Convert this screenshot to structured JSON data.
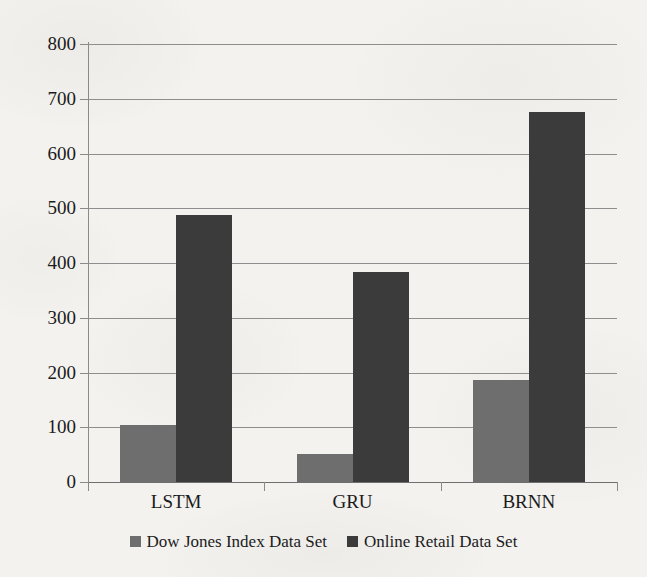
{
  "chart_data": {
    "type": "bar",
    "title": "",
    "xlabel": "",
    "ylabel": "",
    "categories": [
      "LSTM",
      "GRU",
      "BRNN"
    ],
    "series": [
      {
        "name": "Dow Jones Index Data Set",
        "color": "#6e6e6e",
        "values": [
          105,
          52,
          187
        ]
      },
      {
        "name": "Online Retail Data Set",
        "color": "#3b3b3b",
        "values": [
          487,
          383,
          676
        ]
      }
    ],
    "ylim": [
      0,
      800
    ],
    "ytick_step": 100,
    "yticks": [
      "0",
      "100",
      "200",
      "300",
      "400",
      "500",
      "600",
      "700",
      "800"
    ],
    "grid": true,
    "legend_position": "bottom"
  },
  "axes": {
    "y_tick_labels": [
      "800",
      "700",
      "600",
      "500",
      "400",
      "300",
      "200",
      "100",
      "0"
    ],
    "x_tick_labels": [
      "LSTM",
      "GRU",
      "BRNN"
    ]
  },
  "legend": {
    "items": [
      {
        "label": "Dow Jones Index Data Set",
        "swatch": "legend-swatch-dow-jones"
      },
      {
        "label": "Online Retail Data Set",
        "swatch": "legend-swatch-online-retail"
      }
    ]
  },
  "colors": {
    "series_a": "#6e6e6e",
    "series_b": "#3b3b3b",
    "gridline": "#8e8e8e",
    "axis": "#8a8a8a",
    "text": "#1b1b1b",
    "background": "#f3f2ef"
  }
}
